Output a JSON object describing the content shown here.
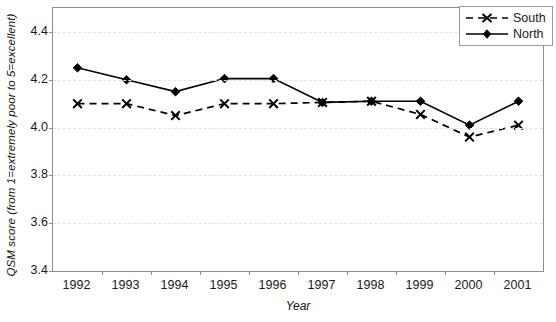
{
  "chart_data": {
    "type": "line",
    "title": "",
    "xlabel": "Year",
    "ylabel": "QSM score (from 1=extremely poor to 5=excellent)",
    "categories": [
      "1992",
      "1993",
      "1994",
      "1995",
      "1996",
      "1997",
      "1998",
      "1999",
      "2000",
      "2001"
    ],
    "x": [
      1992,
      1993,
      1994,
      1995,
      1996,
      1997,
      1998,
      1999,
      2000,
      2001
    ],
    "series": [
      {
        "name": "South",
        "marker": "x",
        "linestyle": "dashed",
        "color": "#000000",
        "values": [
          4.1,
          4.1,
          4.05,
          4.1,
          4.1,
          4.105,
          4.11,
          4.055,
          3.96,
          4.01
        ]
      },
      {
        "name": "North",
        "marker": "diamond",
        "linestyle": "solid",
        "color": "#000000",
        "values": [
          4.25,
          4.2,
          4.15,
          4.205,
          4.205,
          4.105,
          4.11,
          4.11,
          4.01,
          4.11
        ]
      }
    ],
    "ylim": [
      3.4,
      4.5
    ],
    "yticks": [
      3.4,
      3.6,
      3.8,
      4.0,
      4.2,
      4.4
    ],
    "ytick_labels": [
      "3.4",
      "3.6",
      "3.8",
      "4.0",
      "4.2",
      "4.4"
    ],
    "grid": true,
    "grid_axis": "y",
    "grid_color": "#e2e2e2",
    "legend_position": "top-right",
    "frame_color": "#8d8d8d",
    "background": "#ffffff"
  },
  "legend": {
    "items": [
      {
        "label": "South"
      },
      {
        "label": "North"
      }
    ]
  }
}
